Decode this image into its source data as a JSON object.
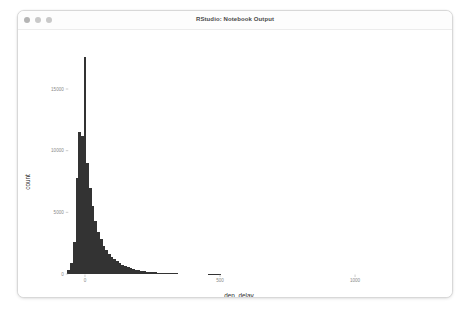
{
  "window": {
    "title": "RStudio: Notebook Output",
    "controls": [
      {
        "name": "close-button",
        "color": "#b4b4b4"
      },
      {
        "name": "minimize-button",
        "color": "#c9c9c9"
      },
      {
        "name": "zoom-button",
        "color": "#c9c9c9"
      }
    ]
  },
  "chart_data": {
    "type": "bar",
    "subtype": "histogram",
    "title": "",
    "xlabel": "dep_delay",
    "ylabel": "count",
    "xlim": [
      -60,
      1300
    ],
    "ylim": [
      0,
      18000
    ],
    "grid": false,
    "legend": null,
    "bar_color": "#333333",
    "binwidth": 10,
    "xticks": [
      0,
      500,
      1000
    ],
    "xtick_labels": [
      "0",
      "500",
      "1000"
    ],
    "yticks": [
      0,
      5000,
      10000,
      15000
    ],
    "ytick_labels": [
      "0",
      "5000",
      "10000",
      "15000"
    ],
    "x": [
      -60,
      -50,
      -40,
      -30,
      -20,
      -10,
      0,
      10,
      20,
      30,
      40,
      50,
      60,
      70,
      80,
      90,
      100,
      110,
      120,
      130,
      140,
      150,
      160,
      170,
      180,
      190,
      200,
      210,
      220,
      230,
      240,
      250,
      260,
      270,
      280,
      290,
      300,
      310,
      320,
      330,
      340,
      350,
      360,
      370,
      380,
      390,
      400,
      410,
      420,
      430,
      440,
      450,
      460,
      470,
      480,
      490,
      500
    ],
    "values": [
      300,
      900,
      2600,
      7800,
      11500,
      11200,
      17600,
      9000,
      7000,
      5500,
      4300,
      3400,
      2800,
      2300,
      1950,
      1650,
      1400,
      1200,
      1020,
      880,
      760,
      650,
      560,
      480,
      415,
      355,
      305,
      265,
      228,
      196,
      170,
      147,
      127,
      110,
      95,
      82,
      71,
      62,
      54,
      47,
      41,
      36,
      31,
      27,
      24,
      21,
      18,
      16,
      14,
      12,
      10,
      9,
      8,
      7,
      6,
      5,
      4
    ]
  }
}
